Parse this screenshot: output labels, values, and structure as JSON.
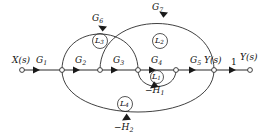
{
  "figure": {
    "kind": "signal-flow-graph",
    "width": 268,
    "height": 140,
    "background_color": "#ffffff",
    "ink_color": "#2b2b2b"
  },
  "inputs": {
    "source_label": "X(s)",
    "output_label_intermediate": "Y(s)",
    "output_label_final": "Y(s)",
    "unity_gain_label": "1"
  },
  "forward_gains": {
    "g1": "G1",
    "g2": "G2",
    "g3": "G3",
    "g4": "G4",
    "g5": "G5",
    "g6": "G6",
    "g7": "G7"
  },
  "feedback_gains": {
    "h1": "-H1",
    "h2": "-H2"
  },
  "loops": {
    "l1": "L1",
    "l2": "L2",
    "l3": "L3",
    "l4": "L4"
  },
  "nodes": [
    {
      "id": "n0",
      "name": "source-node",
      "x": 22,
      "y": 70
    },
    {
      "id": "n1",
      "name": "node-1",
      "x": 62,
      "y": 70
    },
    {
      "id": "n2",
      "name": "node-2",
      "x": 100,
      "y": 70
    },
    {
      "id": "n3",
      "name": "node-3",
      "x": 138,
      "y": 70
    },
    {
      "id": "n4",
      "name": "node-4",
      "x": 176,
      "y": 70
    },
    {
      "id": "n5",
      "name": "output-node",
      "x": 214,
      "y": 70
    },
    {
      "id": "n6",
      "name": "final-output-node",
      "x": 250,
      "y": 70
    }
  ]
}
